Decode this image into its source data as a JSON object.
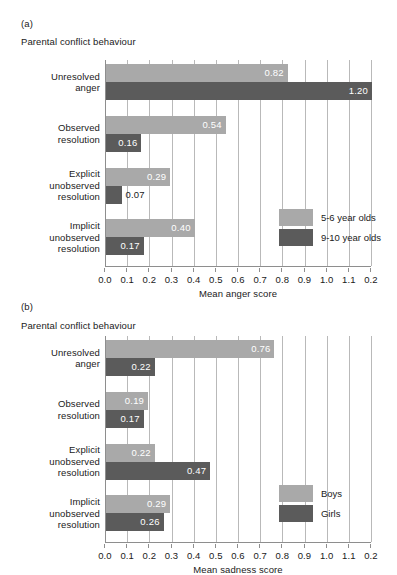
{
  "figure": {
    "background": "#ffffff",
    "color_light": "#a9a9a9",
    "color_dark": "#5b5b5b",
    "grid_color": "#b9b9b9",
    "axis_color": "#8e8e8e"
  },
  "panels": [
    {
      "tag": "(a)",
      "subtitle": "Parental conflict behaviour",
      "xlabel": "Mean anger score",
      "legend": [
        {
          "label": "5-6 year olds",
          "color": "#a9a9a9"
        },
        {
          "label": "9-10 year olds",
          "color": "#5b5b5b"
        }
      ]
    },
    {
      "tag": "(b)",
      "subtitle": "Parental conflict behaviour",
      "xlabel": "Mean sadness score",
      "legend": [
        {
          "label": "Boys",
          "color": "#a9a9a9"
        },
        {
          "label": "Girls",
          "color": "#5b5b5b"
        }
      ]
    }
  ],
  "chart_data": [
    {
      "type": "bar",
      "orientation": "horizontal",
      "panel": "(a)",
      "title": "Parental conflict behaviour",
      "xlabel": "Mean anger score",
      "ylabel": "",
      "xlim": [
        0.0,
        1.2
      ],
      "grid": true,
      "legend_position": "inner-right",
      "categories": [
        "Unresolved anger",
        "Observed resolution",
        "Explicit unobserved resolution",
        "Implicit unobserved resolution"
      ],
      "tick_labels": [
        "0.0",
        "0.1",
        "0.2",
        "0.3",
        "0.4",
        "0.5",
        "0.6",
        "0.7",
        "0.8",
        "0.9",
        "1.0",
        "1.1",
        "0.2"
      ],
      "tick_values": [
        0.0,
        0.1,
        0.2,
        0.3,
        0.4,
        0.5,
        0.6,
        0.7,
        0.8,
        0.9,
        1.0,
        1.1,
        1.2
      ],
      "series": [
        {
          "name": "5-6 year olds",
          "color": "#a9a9a9",
          "values": [
            0.82,
            0.54,
            0.29,
            0.4
          ],
          "value_labels": [
            "0.82",
            "0.54",
            "0.29",
            "0.40"
          ]
        },
        {
          "name": "9-10 year olds",
          "color": "#5b5b5b",
          "values": [
            1.2,
            0.16,
            0.07,
            0.17
          ],
          "value_labels": [
            "1.20",
            "0.16",
            "0.07",
            "0.17"
          ]
        }
      ]
    },
    {
      "type": "bar",
      "orientation": "horizontal",
      "panel": "(b)",
      "title": "Parental conflict behaviour",
      "xlabel": "Mean sadness score",
      "ylabel": "",
      "xlim": [
        0.0,
        1.2
      ],
      "grid": true,
      "legend_position": "inner-right",
      "categories": [
        "Unresolved anger",
        "Observed resolution",
        "Explicit unobserved resolution",
        "Implicit unobserved resolution"
      ],
      "tick_labels": [
        "0.0",
        "0.1",
        "0.2",
        "0.3",
        "0.4",
        "0.5",
        "0.6",
        "0.7",
        "0.8",
        "0.9",
        "1.0",
        "1.1",
        "0.2"
      ],
      "tick_values": [
        0.0,
        0.1,
        0.2,
        0.3,
        0.4,
        0.5,
        0.6,
        0.7,
        0.8,
        0.9,
        1.0,
        1.1,
        1.2
      ],
      "series": [
        {
          "name": "Boys",
          "color": "#a9a9a9",
          "values": [
            0.76,
            0.19,
            0.22,
            0.29
          ],
          "value_labels": [
            "0.76",
            "0.19",
            "0.22",
            "0.29"
          ]
        },
        {
          "name": "Girls",
          "color": "#5b5b5b",
          "values": [
            0.22,
            0.17,
            0.47,
            0.26
          ],
          "value_labels": [
            "0.22",
            "0.17",
            "0.47",
            "0.26"
          ]
        }
      ]
    }
  ],
  "category_lines": [
    [
      "Unresolved",
      "anger"
    ],
    [
      "Observed",
      "resolution"
    ],
    [
      "Explicit",
      "unobserved",
      "resolution"
    ],
    [
      "Implicit",
      "unobserved",
      "resolution"
    ]
  ]
}
